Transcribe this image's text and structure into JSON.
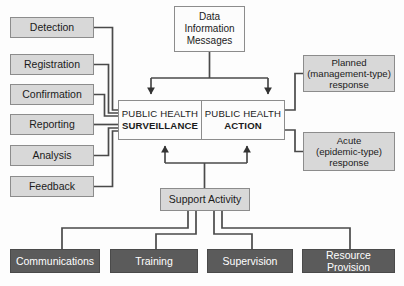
{
  "diagram": {
    "colors": {
      "grey_fill": "#d8d8d8",
      "dark_fill": "#5b5b5b",
      "white_fill": "#fcfcfc",
      "border": "#8c8c8c",
      "wire": "#4a4a4a",
      "text_dark": "#1b1b1b",
      "text_light": "#ffffff"
    },
    "inputs": {
      "label": "Surveillance input activities",
      "items": [
        {
          "id": "detection",
          "label": "Detection"
        },
        {
          "id": "registration",
          "label": "Registration"
        },
        {
          "id": "confirmation",
          "label": "Confirmation"
        },
        {
          "id": "reporting",
          "label": "Reporting"
        },
        {
          "id": "analysis",
          "label": "Analysis"
        },
        {
          "id": "feedback",
          "label": "Feedback"
        }
      ]
    },
    "data_box": {
      "lines": [
        "Data",
        "Information",
        "Messages"
      ]
    },
    "core": {
      "surveillance": {
        "line1": "PUBLIC HEALTH",
        "line2": "SURVEILLANCE"
      },
      "action": {
        "line1": "PUBLIC HEALTH",
        "line2": "ACTION"
      }
    },
    "responses": [
      {
        "id": "planned",
        "lines": [
          "Planned",
          "(management-type)",
          "response"
        ]
      },
      {
        "id": "acute",
        "lines": [
          "Acute",
          "(epidemic-type)",
          "response"
        ]
      }
    ],
    "support": {
      "label": "Support Activity",
      "items": [
        {
          "id": "communications",
          "label": "Communications"
        },
        {
          "id": "training",
          "label": "Training"
        },
        {
          "id": "supervision",
          "label": "Supervision"
        },
        {
          "id": "resource-provision",
          "label": "Resource Provision"
        }
      ]
    }
  }
}
